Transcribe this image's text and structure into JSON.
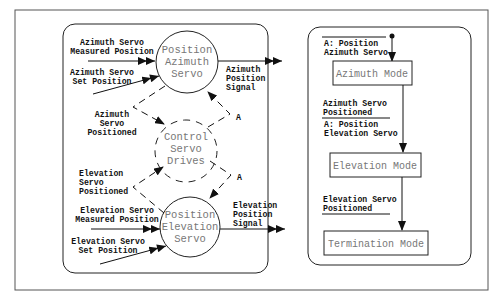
{
  "diagram": {
    "left_panel": {
      "name": "data-flow-diagram",
      "nodes": [
        {
          "id": "position-azimuth-servo",
          "lines": [
            "Position",
            "Azimuth",
            "Servo"
          ],
          "style": "solid"
        },
        {
          "id": "control-servo-drives",
          "lines": [
            "Control",
            "Servo",
            "Drives"
          ],
          "style": "dashed"
        },
        {
          "id": "position-elevation-servo",
          "lines": [
            "Position",
            "Elevation",
            "Servo"
          ],
          "style": "solid"
        }
      ],
      "flows": {
        "az_measured": [
          "Azimuth Servo",
          "Measured Position"
        ],
        "az_set": [
          "Azimuth Servo",
          "Set Position"
        ],
        "az_signal": [
          "Azimuth",
          "Position",
          "Signal"
        ],
        "az_positioned": [
          "Azimuth",
          "Servo",
          "Positioned"
        ],
        "az_activate": "A",
        "el_positioned": [
          "Elevation",
          "Servo",
          "Positioned"
        ],
        "el_activate": "A",
        "el_measured": [
          "Elevation Servo",
          "Measured Position"
        ],
        "el_set": [
          "Elevation Servo",
          "Set Position"
        ],
        "el_signal": [
          "Elevation",
          "Position",
          "Signal"
        ]
      }
    },
    "right_panel": {
      "name": "state-transition-diagram",
      "states": [
        "Azimuth Mode",
        "Elevation Mode",
        "Termination Mode"
      ],
      "transitions": {
        "initial_action": [
          "A: Position",
          "Azimuth Servo"
        ],
        "t1_condition": [
          "Azimuth Servo",
          "Positioned"
        ],
        "t1_action": [
          "A: Position",
          "Elevation Servo"
        ],
        "t2_condition": [
          "Elevation Servo",
          "Positioned"
        ]
      }
    }
  }
}
